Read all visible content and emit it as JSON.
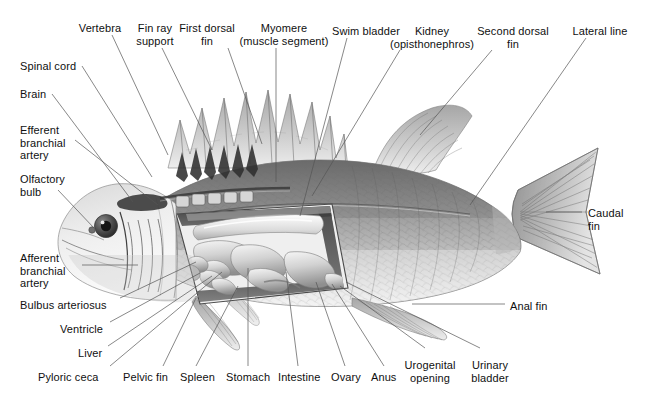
{
  "figure": {
    "background_color": "#ffffff",
    "ink_color": "#101010",
    "leader_color": "#555555",
    "width": 645,
    "height": 401
  },
  "labels": [
    {
      "id": "vertebra",
      "text": "Vertebra",
      "x": 100,
      "y": 22,
      "align": "c"
    },
    {
      "id": "fin-ray-support",
      "text": "Fin ray\nsupport",
      "x": 155,
      "y": 22,
      "align": "c"
    },
    {
      "id": "first-dorsal-fin",
      "text": "First dorsal\nfin",
      "x": 207,
      "y": 22,
      "align": "c"
    },
    {
      "id": "myomere",
      "text": "Myomere\n(muscle segment)",
      "x": 284,
      "y": 22,
      "align": "c"
    },
    {
      "id": "swim-bladder",
      "text": "Swim bladder",
      "x": 366,
      "y": 25,
      "align": "c"
    },
    {
      "id": "kidney",
      "text": "Kidney\n(opisthonephros)",
      "x": 432,
      "y": 25,
      "align": "c"
    },
    {
      "id": "second-dorsal-fin",
      "text": "Second dorsal\nfin",
      "x": 513,
      "y": 25,
      "align": "c"
    },
    {
      "id": "lateral-line",
      "text": "Lateral line",
      "x": 600,
      "y": 25,
      "align": "c"
    },
    {
      "id": "spinal-cord",
      "text": "Spinal cord",
      "x": 20,
      "y": 60,
      "align": "l"
    },
    {
      "id": "brain",
      "text": "Brain",
      "x": 20,
      "y": 88,
      "align": "l"
    },
    {
      "id": "efferent-branchial",
      "text": "Efferent\nbranchial\nartery",
      "x": 20,
      "y": 124,
      "align": "l"
    },
    {
      "id": "olfactory-bulb",
      "text": "Olfactory\nbulb",
      "x": 20,
      "y": 173,
      "align": "l"
    },
    {
      "id": "afferent-branchial",
      "text": "Afferent\nbranchial\nartery",
      "x": 20,
      "y": 252,
      "align": "l"
    },
    {
      "id": "bulbus-arteriosus",
      "text": "Bulbus arteriosus",
      "x": 20,
      "y": 299,
      "align": "l"
    },
    {
      "id": "ventricle",
      "text": "Ventricle",
      "x": 60,
      "y": 323,
      "align": "l"
    },
    {
      "id": "liver",
      "text": "Liver",
      "x": 78,
      "y": 347,
      "align": "l"
    },
    {
      "id": "pyloric-ceca",
      "text": "Pyloric ceca",
      "x": 38,
      "y": 371,
      "align": "l"
    },
    {
      "id": "pelvic-fin",
      "text": "Pelvic fin",
      "x": 123,
      "y": 371,
      "align": "l"
    },
    {
      "id": "spleen",
      "text": "Spleen",
      "x": 180,
      "y": 371,
      "align": "l"
    },
    {
      "id": "stomach",
      "text": "Stomach",
      "x": 226,
      "y": 371,
      "align": "l"
    },
    {
      "id": "intestine",
      "text": "Intestine",
      "x": 278,
      "y": 371,
      "align": "l"
    },
    {
      "id": "ovary",
      "text": "Ovary",
      "x": 331,
      "y": 371,
      "align": "l"
    },
    {
      "id": "anus",
      "text": "Anus",
      "x": 371,
      "y": 371,
      "align": "l"
    },
    {
      "id": "urogenital-opening",
      "text": "Urogenital\nopening",
      "x": 430,
      "y": 359,
      "align": "c"
    },
    {
      "id": "urinary-bladder",
      "text": "Urinary\nbladder",
      "x": 490,
      "y": 359,
      "align": "c"
    },
    {
      "id": "caudal-fin",
      "text": "Caudal\nfin",
      "x": 588,
      "y": 207,
      "align": "l"
    },
    {
      "id": "anal-fin",
      "text": "Anal fin",
      "x": 510,
      "y": 300,
      "align": "l"
    }
  ],
  "leaders": [
    {
      "id": "vertebra",
      "x1": 112,
      "y1": 35,
      "x2": 168,
      "y2": 155
    },
    {
      "id": "fin-ray-support",
      "x1": 162,
      "y1": 48,
      "x2": 212,
      "y2": 150
    },
    {
      "id": "first-dorsal-fin",
      "x1": 228,
      "y1": 48,
      "x2": 262,
      "y2": 144
    },
    {
      "id": "myomere",
      "x1": 276,
      "y1": 48,
      "x2": 276,
      "y2": 182
    },
    {
      "id": "swim-bladder",
      "x1": 347,
      "y1": 38,
      "x2": 300,
      "y2": 216
    },
    {
      "id": "kidney",
      "x1": 400,
      "y1": 50,
      "x2": 312,
      "y2": 196
    },
    {
      "id": "second-dorsal-fin",
      "x1": 492,
      "y1": 50,
      "x2": 420,
      "y2": 135
    },
    {
      "id": "lateral-line",
      "x1": 586,
      "y1": 38,
      "x2": 470,
      "y2": 205
    },
    {
      "id": "spinal-cord",
      "x1": 82,
      "y1": 66,
      "x2": 152,
      "y2": 177
    },
    {
      "id": "brain",
      "x1": 52,
      "y1": 94,
      "x2": 133,
      "y2": 202
    },
    {
      "id": "efferent-branchial",
      "x1": 75,
      "y1": 140,
      "x2": 158,
      "y2": 205
    },
    {
      "id": "olfactory-bulb",
      "x1": 58,
      "y1": 190,
      "x2": 94,
      "y2": 228
    },
    {
      "id": "afferent-branchial",
      "x1": 82,
      "y1": 265,
      "x2": 138,
      "y2": 265
    },
    {
      "id": "bulbus-arteriosus",
      "x1": 120,
      "y1": 298,
      "x2": 196,
      "y2": 262
    },
    {
      "id": "ventricle",
      "x1": 110,
      "y1": 322,
      "x2": 200,
      "y2": 273
    },
    {
      "id": "liver",
      "x1": 108,
      "y1": 346,
      "x2": 212,
      "y2": 276
    },
    {
      "id": "pyloric-ceca",
      "x1": 110,
      "y1": 366,
      "x2": 222,
      "y2": 272
    },
    {
      "id": "pelvic-fin",
      "x1": 163,
      "y1": 366,
      "x2": 196,
      "y2": 298
    },
    {
      "id": "spleen",
      "x1": 196,
      "y1": 366,
      "x2": 238,
      "y2": 286
    },
    {
      "id": "stomach",
      "x1": 248,
      "y1": 366,
      "x2": 248,
      "y2": 268
    },
    {
      "id": "intestine",
      "x1": 298,
      "y1": 366,
      "x2": 286,
      "y2": 272
    },
    {
      "id": "ovary",
      "x1": 345,
      "y1": 366,
      "x2": 316,
      "y2": 282
    },
    {
      "id": "anus",
      "x1": 384,
      "y1": 366,
      "x2": 332,
      "y2": 284
    },
    {
      "id": "urogenital-opening",
      "x1": 425,
      "y1": 348,
      "x2": 340,
      "y2": 286
    },
    {
      "id": "urinary-bladder",
      "x1": 480,
      "y1": 348,
      "x2": 346,
      "y2": 282
    },
    {
      "id": "caudal-fin",
      "x1": 582,
      "y1": 212,
      "x2": 546,
      "y2": 212
    },
    {
      "id": "anal-fin",
      "x1": 505,
      "y1": 304,
      "x2": 412,
      "y2": 304
    }
  ]
}
